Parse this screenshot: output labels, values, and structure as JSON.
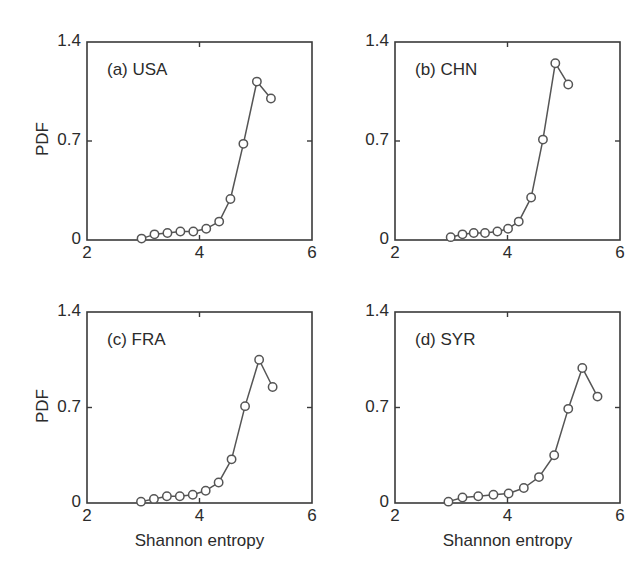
{
  "figure": {
    "background": "#ffffff",
    "line_color": "#555555",
    "marker_color": "#555555",
    "marker_face": "#ffffff",
    "axis_color": "#3a3a3a"
  },
  "common": {
    "xlabel": "Shannon entropy",
    "ylabel": "PDF",
    "xticks": [
      "2",
      "4",
      "6"
    ],
    "xtick_values": [
      2,
      4,
      6
    ],
    "yticks": [
      "0",
      "0.7",
      "1.4"
    ],
    "ytick_values": [
      0,
      0.7,
      1.4
    ],
    "xlim": [
      2,
      6
    ],
    "ylim": [
      0,
      1.4
    ]
  },
  "chart_data": [
    {
      "type": "line",
      "panel": "a",
      "title": "(a) USA",
      "title_label": "(a)",
      "title_country": "USA",
      "xlabel": "",
      "ylabel": "PDF",
      "xlim": [
        2,
        6
      ],
      "ylim": [
        0,
        1.4
      ],
      "xticks": [
        2,
        4,
        6
      ],
      "yticks": [
        0,
        0.7,
        1.4
      ],
      "grid": false,
      "legend": "none",
      "marker": "circle",
      "x": [
        2.97,
        3.2,
        3.43,
        3.66,
        3.89,
        4.12,
        4.35,
        4.55,
        4.78,
        5.02,
        5.27
      ],
      "y": [
        0.01,
        0.04,
        0.05,
        0.06,
        0.06,
        0.08,
        0.13,
        0.29,
        0.68,
        1.12,
        1.0
      ]
    },
    {
      "type": "line",
      "panel": "b",
      "title": "(b) CHN",
      "title_label": "(b)",
      "title_country": "CHN",
      "xlabel": "",
      "ylabel": "",
      "xlim": [
        2,
        6
      ],
      "ylim": [
        0,
        1.4
      ],
      "xticks": [
        2,
        4,
        6
      ],
      "yticks": [
        0,
        0.7,
        1.4
      ],
      "grid": false,
      "legend": "none",
      "marker": "circle",
      "x": [
        2.99,
        3.2,
        3.4,
        3.6,
        3.82,
        4.01,
        4.2,
        4.42,
        4.63,
        4.85,
        5.08
      ],
      "y": [
        0.02,
        0.04,
        0.05,
        0.05,
        0.06,
        0.08,
        0.13,
        0.3,
        0.71,
        1.25,
        1.1
      ]
    },
    {
      "type": "line",
      "panel": "c",
      "title": "(c) FRA",
      "title_label": "(c)",
      "title_country": "FRA",
      "xlabel": "Shannon entropy",
      "ylabel": "PDF",
      "xlim": [
        2,
        6
      ],
      "ylim": [
        0,
        1.4
      ],
      "xticks": [
        2,
        4,
        6
      ],
      "yticks": [
        0,
        0.7,
        1.4
      ],
      "grid": false,
      "legend": "none",
      "marker": "circle",
      "x": [
        2.96,
        3.19,
        3.42,
        3.65,
        3.88,
        4.11,
        4.34,
        4.57,
        4.81,
        5.06,
        5.3
      ],
      "y": [
        0.01,
        0.03,
        0.05,
        0.05,
        0.06,
        0.09,
        0.15,
        0.32,
        0.71,
        1.05,
        0.85
      ]
    },
    {
      "type": "line",
      "panel": "d",
      "title": "(d) SYR",
      "title_label": "(d)",
      "title_country": "SYR",
      "xlabel": "Shannon entropy",
      "ylabel": "",
      "xlim": [
        2,
        6
      ],
      "ylim": [
        0,
        1.4
      ],
      "xticks": [
        2,
        4,
        6
      ],
      "yticks": [
        0,
        0.7,
        1.4
      ],
      "grid": false,
      "legend": "none",
      "marker": "circle",
      "x": [
        2.95,
        3.2,
        3.48,
        3.75,
        4.02,
        4.29,
        4.56,
        4.83,
        5.08,
        5.33,
        5.6
      ],
      "y": [
        0.01,
        0.04,
        0.05,
        0.06,
        0.07,
        0.11,
        0.19,
        0.35,
        0.69,
        0.99,
        0.78
      ]
    }
  ]
}
